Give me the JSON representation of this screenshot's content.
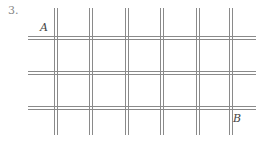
{
  "problem_number": "3.",
  "labels": {
    "start": "A",
    "end": "B"
  },
  "grid": {
    "columns": 6,
    "rows": 4,
    "vertical_lines_x": [
      54,
      89,
      125,
      160,
      196,
      229
    ],
    "horizontal_lines_y": [
      36,
      71,
      106
    ],
    "line_color": "#888888",
    "left": 28,
    "right": 256,
    "top": 8,
    "bottom": 135
  }
}
